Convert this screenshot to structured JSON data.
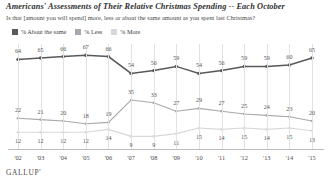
{
  "title": "Americans' Assessments of Their Relative Christmas Spending -- Each October",
  "subtitle": "Is that [amount you will spend] more, less or about the same amount as you spent last Christmas?",
  "brand": "GALLUP'",
  "colors": {
    "same": "#58595b",
    "less": "#a7a9ac",
    "more": "#d6d7d8",
    "grid": "#e2e2e2",
    "axis": "#bdbdbd",
    "text": "#3a3a3a"
  },
  "legend": [
    {
      "label": "% About the same",
      "color": "#58595b"
    },
    {
      "label": "% Less",
      "color": "#a7a9ac"
    },
    {
      "label": "% More",
      "color": "#d6d7d8"
    }
  ],
  "chart_data": {
    "type": "line",
    "title": "Americans' Assessments of Their Relative Christmas Spending -- Each October",
    "subtitle": "Is that [amount you will spend] more, less or about the same amount as you spent last Christmas?",
    "xlabel": "",
    "ylabel": "",
    "ylim": [
      0,
      75
    ],
    "grid": true,
    "legend_position": "top-left",
    "categories": [
      "'02",
      "'03",
      "'04",
      "'05",
      "'06",
      "'07",
      "'08",
      "'09",
      "'10",
      "'11",
      "'12",
      "'13",
      "'14",
      "'15"
    ],
    "series": [
      {
        "name": "% About the same",
        "color": "#58595b",
        "values": [
          64,
          65,
          66,
          67,
          66,
          54,
          56,
          59,
          54,
          56,
          59,
          59,
          60,
          65
        ]
      },
      {
        "name": "% Less",
        "color": "#a7a9ac",
        "values": [
          22,
          21,
          20,
          18,
          19,
          35,
          33,
          27,
          29,
          27,
          25,
          24,
          23,
          20
        ]
      },
      {
        "name": "% More",
        "color": "#d6d7d8",
        "values": [
          12,
          12,
          12,
          12,
          14,
          9,
          9,
          11,
          15,
          14,
          15,
          14,
          15,
          13
        ]
      }
    ]
  }
}
